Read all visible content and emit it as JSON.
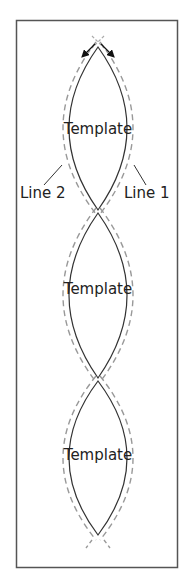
{
  "diagram": {
    "labels": {
      "line1": "Line 1",
      "line2": "Line 2"
    },
    "lenses": [
      {
        "label": "Template"
      },
      {
        "label": "Template"
      },
      {
        "label": "Template"
      }
    ],
    "colors": {
      "solid_line": "#333333",
      "dashed_line": "#999999",
      "frame": "#555555",
      "arrow": "#111111"
    }
  }
}
